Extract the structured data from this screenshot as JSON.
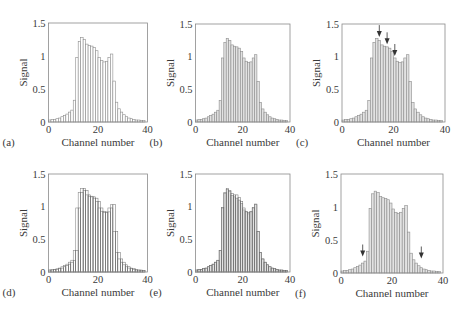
{
  "figure": {
    "colors": {
      "axis": "#8a8a8a",
      "bar_outline": "#8c8c8c",
      "bar_fill_open": "#ffffff",
      "bar_fill_hatched": "#e2e2e2",
      "overlay_outline": "#6a6a6a",
      "arrow": "#333333",
      "text": "#3a3a3a"
    }
  },
  "chart_data": [
    {
      "panel_label": "(a)",
      "type": "bar",
      "style": "open",
      "xlabel": "Channel number",
      "ylabel": "Signal",
      "xlim": [
        0,
        40
      ],
      "ylim": [
        0,
        1.5
      ],
      "xticks": [
        "0",
        "20",
        "40"
      ],
      "yticks": [
        "0",
        "0.5",
        "1",
        "1.5"
      ],
      "x": [
        0,
        1,
        2,
        3,
        4,
        5,
        6,
        7,
        8,
        9,
        10,
        11,
        12,
        13,
        14,
        15,
        16,
        17,
        18,
        19,
        20,
        21,
        22,
        23,
        24,
        25,
        26,
        27,
        28,
        29,
        30,
        31,
        32,
        33,
        34,
        35,
        36,
        37,
        38
      ],
      "series": [
        {
          "name": "signal",
          "values": [
            0.03,
            0.04,
            0.04,
            0.05,
            0.06,
            0.08,
            0.1,
            0.12,
            0.15,
            0.18,
            0.33,
            0.98,
            1.22,
            1.28,
            1.25,
            1.18,
            1.16,
            1.15,
            1.13,
            1.08,
            0.98,
            0.93,
            0.91,
            0.92,
            0.98,
            1.03,
            0.62,
            0.3,
            0.2,
            0.15,
            0.11,
            0.08,
            0.06,
            0.05,
            0.04,
            0.03,
            0.03,
            0.02,
            0.02
          ]
        }
      ],
      "arrows": []
    },
    {
      "panel_label": "(b)",
      "type": "bar",
      "style": "hatched",
      "xlabel": "Channel number",
      "ylabel": "Signal",
      "xlim": [
        0,
        40
      ],
      "ylim": [
        0,
        1.5
      ],
      "xticks": [
        "0",
        "20",
        "40"
      ],
      "yticks": [
        "0",
        "0.5",
        "1",
        "1.5"
      ],
      "x": [
        0,
        1,
        2,
        3,
        4,
        5,
        6,
        7,
        8,
        9,
        10,
        11,
        12,
        13,
        14,
        15,
        16,
        17,
        18,
        19,
        20,
        21,
        22,
        23,
        24,
        25,
        26,
        27,
        28,
        29,
        30,
        31,
        32,
        33,
        34,
        35,
        36,
        37,
        38
      ],
      "series": [
        {
          "name": "signal",
          "values": [
            0.03,
            0.04,
            0.04,
            0.05,
            0.06,
            0.08,
            0.1,
            0.12,
            0.15,
            0.18,
            0.33,
            0.98,
            1.22,
            1.28,
            1.25,
            1.18,
            1.16,
            1.15,
            1.13,
            1.08,
            0.98,
            0.93,
            0.91,
            0.92,
            0.98,
            1.03,
            0.62,
            0.3,
            0.2,
            0.15,
            0.11,
            0.08,
            0.06,
            0.05,
            0.04,
            0.03,
            0.03,
            0.02,
            0.02
          ]
        }
      ],
      "arrows": []
    },
    {
      "panel_label": "(c)",
      "type": "bar",
      "style": "hatched",
      "xlabel": "Channel number",
      "ylabel": "Signal",
      "xlim": [
        0,
        40
      ],
      "ylim": [
        0,
        1.5
      ],
      "xticks": [
        "0",
        "20",
        "40"
      ],
      "yticks": [
        "0",
        "0.5",
        "1",
        "1.5"
      ],
      "x": [
        0,
        1,
        2,
        3,
        4,
        5,
        6,
        7,
        8,
        9,
        10,
        11,
        12,
        13,
        14,
        15,
        16,
        17,
        18,
        19,
        20,
        21,
        22,
        23,
        24,
        25,
        26,
        27,
        28,
        29,
        30,
        31,
        32,
        33,
        34,
        35,
        36,
        37,
        38
      ],
      "series": [
        {
          "name": "signal",
          "values": [
            0.03,
            0.04,
            0.04,
            0.05,
            0.06,
            0.08,
            0.1,
            0.12,
            0.15,
            0.18,
            0.33,
            0.98,
            1.22,
            1.28,
            1.25,
            1.18,
            1.16,
            1.15,
            1.13,
            1.08,
            0.98,
            0.93,
            0.91,
            0.92,
            0.98,
            1.03,
            0.62,
            0.3,
            0.2,
            0.15,
            0.11,
            0.08,
            0.06,
            0.05,
            0.04,
            0.03,
            0.03,
            0.02,
            0.02
          ]
        }
      ],
      "arrows": [
        {
          "channel": 14,
          "tip_value": 1.3
        },
        {
          "channel": 17,
          "tip_value": 1.19
        },
        {
          "channel": 20,
          "tip_value": 1.01
        }
      ]
    },
    {
      "panel_label": "(d)",
      "type": "bar",
      "style": "open",
      "xlabel": "Channel number",
      "ylabel": "Signal",
      "xlim": [
        0,
        40
      ],
      "ylim": [
        0,
        1.5
      ],
      "xticks": [
        "0",
        "20",
        "40"
      ],
      "yticks": [
        "0",
        "0.5",
        "1",
        "1.5"
      ],
      "x": [
        0,
        1,
        2,
        3,
        4,
        5,
        6,
        7,
        8,
        9,
        10,
        11,
        12,
        13,
        14,
        15,
        16,
        17,
        18,
        19,
        20,
        21,
        22,
        23,
        24,
        25,
        26,
        27,
        28,
        29,
        30,
        31,
        32,
        33,
        34,
        35,
        36,
        37,
        38
      ],
      "series": [
        {
          "name": "signal",
          "values": [
            0.03,
            0.04,
            0.04,
            0.05,
            0.06,
            0.08,
            0.1,
            0.12,
            0.15,
            0.18,
            0.33,
            0.98,
            1.22,
            1.28,
            1.25,
            1.18,
            1.16,
            1.15,
            1.13,
            1.08,
            0.98,
            0.93,
            0.91,
            0.92,
            0.98,
            1.03,
            0.62,
            0.3,
            0.2,
            0.15,
            0.11,
            0.08,
            0.06,
            0.05,
            0.04,
            0.03,
            0.03,
            0.02,
            0.02
          ]
        },
        {
          "name": "shifted",
          "values": [
            0.03,
            0.03,
            0.04,
            0.04,
            0.05,
            0.06,
            0.08,
            0.1,
            0.12,
            0.15,
            0.18,
            0.33,
            0.98,
            1.22,
            1.28,
            1.25,
            1.18,
            1.16,
            1.15,
            1.13,
            1.08,
            0.98,
            0.93,
            0.91,
            0.92,
            0.98,
            1.03,
            0.62,
            0.3,
            0.2,
            0.15,
            0.11,
            0.08,
            0.06,
            0.05,
            0.04,
            0.03,
            0.03,
            0.02
          ]
        }
      ],
      "arrows": []
    },
    {
      "panel_label": "(e)",
      "type": "bar",
      "style": "hatched",
      "xlabel": "Channel number",
      "ylabel": "Signal",
      "xlim": [
        0,
        40
      ],
      "ylim": [
        0,
        1.5
      ],
      "xticks": [
        "0",
        "20",
        "40"
      ],
      "yticks": [
        "0",
        "0.5",
        "1",
        "1.5"
      ],
      "x": [
        0,
        1,
        2,
        3,
        4,
        5,
        6,
        7,
        8,
        9,
        10,
        11,
        12,
        13,
        14,
        15,
        16,
        17,
        18,
        19,
        20,
        21,
        22,
        23,
        24,
        25,
        26,
        27,
        28,
        29,
        30,
        31,
        32,
        33,
        34,
        35,
        36,
        37,
        38
      ],
      "series": [
        {
          "name": "signal",
          "values": [
            0.03,
            0.04,
            0.04,
            0.05,
            0.06,
            0.08,
            0.1,
            0.12,
            0.15,
            0.18,
            0.33,
            0.98,
            1.2,
            1.26,
            1.23,
            1.17,
            1.15,
            1.13,
            1.1,
            1.05,
            0.95,
            0.92,
            0.89,
            0.92,
            0.98,
            1.03,
            0.62,
            0.3,
            0.2,
            0.15,
            0.11,
            0.08,
            0.06,
            0.05,
            0.04,
            0.03,
            0.03,
            0.02,
            0.02
          ]
        },
        {
          "name": "overlay",
          "values": [
            0.03,
            0.04,
            0.04,
            0.05,
            0.06,
            0.08,
            0.1,
            0.12,
            0.15,
            0.18,
            0.33,
            0.99,
            1.22,
            1.28,
            1.25,
            1.2,
            1.18,
            1.18,
            1.14,
            1.08,
            0.98,
            0.93,
            0.91,
            0.93,
            0.99,
            1.04,
            0.62,
            0.3,
            0.2,
            0.15,
            0.11,
            0.08,
            0.06,
            0.05,
            0.04,
            0.03,
            0.03,
            0.02,
            0.02
          ]
        }
      ],
      "arrows": []
    },
    {
      "panel_label": "(f)",
      "type": "bar",
      "style": "hatched",
      "xlabel": "Channel number",
      "ylabel": "Signal",
      "xlim": [
        0,
        40
      ],
      "ylim": [
        0,
        1.5
      ],
      "xticks": [
        "0",
        "20",
        "40"
      ],
      "yticks": [
        "0",
        "0.5",
        "1",
        "1.5"
      ],
      "x": [
        0,
        1,
        2,
        3,
        4,
        5,
        6,
        7,
        8,
        9,
        10,
        11,
        12,
        13,
        14,
        15,
        16,
        17,
        18,
        19,
        20,
        21,
        22,
        23,
        24,
        25,
        26,
        27,
        28,
        29,
        30,
        31,
        32,
        33,
        34,
        35,
        36,
        37,
        38
      ],
      "series": [
        {
          "name": "signal",
          "values": [
            0.03,
            0.04,
            0.04,
            0.05,
            0.06,
            0.08,
            0.1,
            0.12,
            0.15,
            0.18,
            0.33,
            0.98,
            1.2,
            1.24,
            1.22,
            1.16,
            1.14,
            1.13,
            1.11,
            1.06,
            0.97,
            0.92,
            0.9,
            0.92,
            0.98,
            1.02,
            0.62,
            0.3,
            0.2,
            0.15,
            0.11,
            0.08,
            0.06,
            0.05,
            0.04,
            0.03,
            0.03,
            0.02,
            0.02
          ]
        }
      ],
      "arrows": [
        {
          "channel": 8,
          "tip_value": 0.25
        },
        {
          "channel": 31,
          "tip_value": 0.22
        }
      ]
    }
  ]
}
